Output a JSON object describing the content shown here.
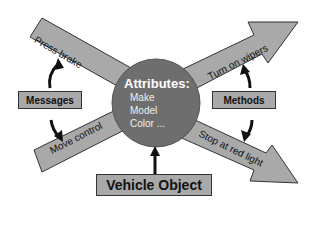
{
  "diagram": {
    "center": {
      "title": "Attributes:",
      "items": [
        "Make",
        "Model",
        "Color ..."
      ]
    },
    "arrows": {
      "top_left": "Press brake",
      "bottom_left": "Move control",
      "top_right": "Turn on wipers",
      "bottom_right": "Stop at red light"
    },
    "boxes": {
      "left": "Messages",
      "right": "Methods",
      "bottom": "Vehicle Object"
    },
    "colors": {
      "arrow_fill": "#a9a9a9",
      "circle_fill": "#6e6e6e",
      "box_fill": "#a9a9a9",
      "outline": "#333333",
      "circle_text": "#ffffff"
    }
  }
}
